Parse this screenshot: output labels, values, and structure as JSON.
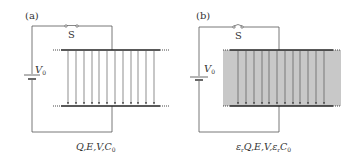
{
  "panels": [
    {
      "id": "a",
      "label": "(a)",
      "switch_label": "S",
      "battery_label": "V",
      "battery_sub": "0",
      "dielectric": false,
      "caption": {
        "parts": [
          "Q",
          ",",
          "E",
          ",",
          "V",
          ",",
          "C"
        ],
        "sub": "0"
      },
      "caption_text": "Q,E,V,C0",
      "field_lines": 12
    },
    {
      "id": "b",
      "label": "(b)",
      "switch_label": "S",
      "battery_label": "V",
      "battery_sub": "0",
      "dielectric": true,
      "caption_text": "εrQ,E,V,εrC0",
      "field_lines": 12
    }
  ],
  "colors": {
    "wire": "#555555",
    "plate": "#222222",
    "field": "#444444",
    "dielectric": "#c8c8c8",
    "text": "#333333"
  }
}
